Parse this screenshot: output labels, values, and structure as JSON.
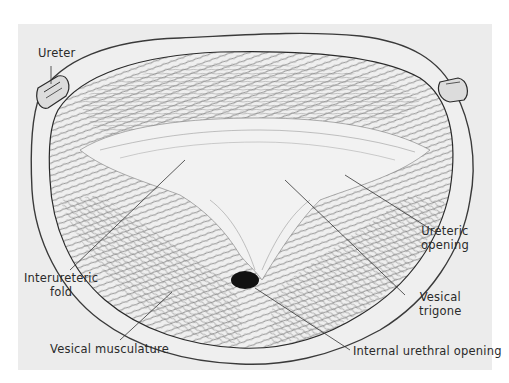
{
  "figure": {
    "background_color": "#ececec",
    "labels": {
      "ureter": "Ureter",
      "ureteric_opening_1": "Ureteric",
      "ureteric_opening_2": "opening",
      "interureteric_fold_1": "Interureteric",
      "interureteric_fold_2": "fold",
      "vesical_trigone_1": "Vesical",
      "vesical_trigone_2": "trigone",
      "vesical_musculature": "Vesical  musculature",
      "internal_urethral_opening": "Internal  urethral opening"
    }
  }
}
